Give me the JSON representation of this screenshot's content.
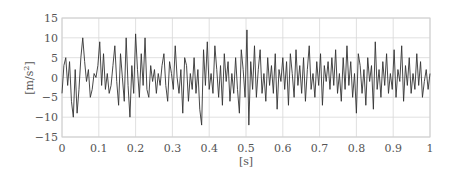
{
  "chart_data": {
    "type": "line",
    "title": "",
    "xlabel": "[s]",
    "ylabel": "[m/s²]",
    "xlim": [
      0,
      1
    ],
    "ylim": [
      -15,
      15
    ],
    "xticks": [
      "0",
      "0.1",
      "0.2",
      "0.3",
      "0.4",
      "0.5",
      "0.6",
      "0.7",
      "0.8",
      "0.9",
      "1"
    ],
    "yticks": [
      "15",
      "10",
      "5",
      "0",
      "−5",
      "−10",
      "−15"
    ],
    "grid": true,
    "legend": null,
    "line_color": "#333333",
    "grid_color": "#d8d8d8",
    "series": [
      {
        "name": "acceleration",
        "x_start": 0,
        "x_step": 0.005,
        "values": [
          -4,
          3,
          5,
          -2,
          4,
          -6,
          -10,
          2,
          -9,
          -3,
          5,
          10,
          4,
          -1,
          2,
          -5,
          -3,
          1,
          0,
          3,
          9,
          -2,
          6,
          -3,
          1,
          -4,
          -2,
          3,
          8,
          -1,
          -7,
          6,
          0,
          -6,
          10,
          -2,
          -10,
          3,
          -4,
          11,
          2,
          -5,
          6,
          -2,
          10,
          -3,
          -5,
          3,
          -1,
          2,
          -4,
          1,
          -2,
          3,
          6,
          -2,
          -6,
          4,
          1,
          -3,
          8,
          0,
          -4,
          2,
          -9,
          5,
          3,
          -6,
          1,
          -3,
          5,
          -4,
          2,
          -8,
          -12,
          7,
          -2,
          9,
          -3,
          1,
          -4,
          8,
          2,
          -5,
          3,
          -7,
          6,
          -1,
          4,
          -6,
          1,
          -4,
          5,
          -3,
          -9,
          7,
          2,
          -5,
          12,
          -12,
          4,
          -3,
          8,
          -5,
          2,
          7,
          -4,
          1,
          -6,
          5,
          -2,
          3,
          -4,
          6,
          -8,
          2,
          -1,
          5,
          -3,
          4,
          -7,
          6,
          1,
          -5,
          7,
          -2,
          3,
          -4,
          5,
          -6,
          2,
          8,
          -3,
          1,
          -5,
          4,
          -2,
          6,
          -7,
          3,
          -1,
          4,
          -3,
          5,
          -2,
          7,
          -4,
          1,
          -6,
          5,
          -3,
          8,
          -2,
          4,
          -5,
          1,
          -9,
          6,
          3,
          -4,
          2,
          -7,
          5,
          -1,
          3,
          -8,
          9,
          -3,
          2,
          -5,
          4,
          -2,
          6,
          -4,
          1,
          -3,
          7,
          -5,
          2,
          -1,
          8,
          -6,
          3,
          -2,
          5,
          -4,
          1,
          -3,
          6,
          -2,
          4,
          -5,
          -1,
          2,
          -3,
          1
        ]
      }
    ]
  }
}
